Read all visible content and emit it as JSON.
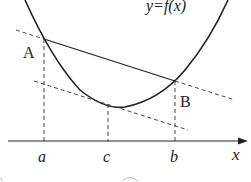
{
  "diagram": {
    "curve_label": "y=f(x)",
    "points": {
      "A": {
        "label": "A"
      },
      "B": {
        "label": "B"
      }
    },
    "axis": {
      "x_label": "x",
      "ticks": [
        {
          "id": "a",
          "label": "a"
        },
        {
          "id": "c",
          "label": "c"
        },
        {
          "id": "b",
          "label": "b"
        }
      ]
    },
    "colors": {
      "stroke": "#222222",
      "background": "#ffffff"
    }
  }
}
